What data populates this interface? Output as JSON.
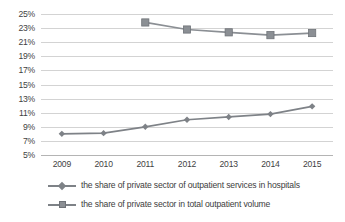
{
  "chart_data": {
    "type": "line",
    "title": "",
    "xlabel": "",
    "ylabel": "",
    "categories": [
      "2009",
      "2010",
      "2011",
      "2012",
      "2013",
      "2014",
      "2015"
    ],
    "ylim": [
      5,
      25
    ],
    "ytick_step": 2,
    "ytick_labels": [
      "25%",
      "23%",
      "21%",
      "19%",
      "17%",
      "15%",
      "13%",
      "11%",
      "9%",
      "7%",
      "5%"
    ],
    "ytick_values": [
      25,
      23,
      21,
      19,
      17,
      15,
      13,
      11,
      9,
      7,
      5
    ],
    "grid": true,
    "legend_position": "bottom-left",
    "series": [
      {
        "name": "the share of private sector of outpatient services in hospitals",
        "marker": "diamond",
        "color": "#7e8287",
        "x": [
          "2009",
          "2010",
          "2011",
          "2012",
          "2013",
          "2014",
          "2015"
        ],
        "values": [
          8.0,
          8.1,
          9.0,
          10.0,
          10.4,
          10.8,
          11.9
        ]
      },
      {
        "name": "the share of private sector in total outpatient volume",
        "marker": "square",
        "color": "#8b8f94",
        "x": [
          "2011",
          "2012",
          "2013",
          "2014",
          "2015"
        ],
        "values": [
          23.8,
          22.8,
          22.4,
          22.0,
          22.3
        ]
      }
    ]
  },
  "colors": {
    "series_1": "#7e8287",
    "series_2": "#8b8f94",
    "gridline": "#d3d3d3",
    "axis": "#b4b4b4",
    "text": "#3d3d3d",
    "background": "#ffffff"
  },
  "legend": {
    "items": [
      {
        "label": "the share of private sector of outpatient services in hospitals",
        "marker": "diamond-line-marker"
      },
      {
        "label": "the share of private sector in total outpatient volume",
        "marker": "square-line-marker"
      }
    ]
  }
}
